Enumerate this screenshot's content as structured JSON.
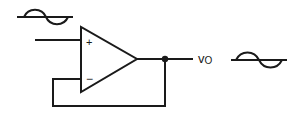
{
  "diagram": {
    "type": "op-amp voltage follower",
    "component": "operational amplifier",
    "inputs": {
      "non_inverting_label": "+",
      "inverting_label": "−"
    },
    "output": {
      "label_main": "v",
      "label_sub": "O"
    },
    "waveforms": [
      {
        "name": "input-sine-wave",
        "position": "above non-inverting input"
      },
      {
        "name": "output-sine-wave",
        "position": "right of output"
      }
    ],
    "feedback": "output connected to inverting input",
    "colors": {
      "stroke": "#1a1a1a",
      "background": "#ffffff"
    }
  }
}
